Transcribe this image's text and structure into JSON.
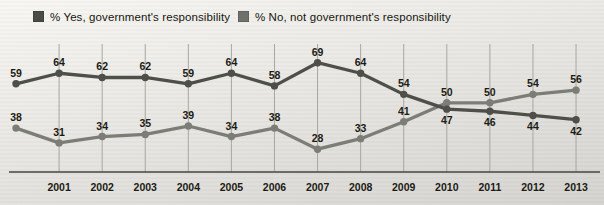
{
  "legend": {
    "items": [
      {
        "id": "yes",
        "label": "% Yes, government's responsibility",
        "swatch_color": "#4b4b46"
      },
      {
        "id": "no",
        "label": "% No, not government's responsibility",
        "swatch_color": "#71716b"
      }
    ]
  },
  "chart_data": {
    "type": "line",
    "x": [
      2000,
      2001,
      2002,
      2003,
      2004,
      2005,
      2006,
      2007,
      2008,
      2009,
      2010,
      2011,
      2012,
      2013
    ],
    "x_tick_labels": [
      "2001",
      "2002",
      "2003",
      "2004",
      "2005",
      "2006",
      "2007",
      "2008",
      "2009",
      "2010",
      "2011",
      "2012",
      "2013"
    ],
    "series": [
      {
        "name": "% Yes, government's responsibility",
        "color": "#4f4f4a",
        "values": [
          59,
          64,
          62,
          62,
          59,
          64,
          58,
          69,
          64,
          54,
          47,
          46,
          44,
          42
        ]
      },
      {
        "name": "% No, not government's responsibility",
        "color": "#7d7d77",
        "values": [
          38,
          31,
          34,
          35,
          39,
          34,
          38,
          28,
          33,
          41,
          50,
          50,
          54,
          56
        ]
      }
    ],
    "ylim": [
      17,
      78
    ],
    "grid": "vertical-on-labeled-years",
    "legend_position": "top",
    "data_labels": true
  },
  "colors": {
    "grid_line": "#a7a7a1",
    "axis_line": "#45453f",
    "value_label": "#1b1b14",
    "tick_label": "#1b1b14"
  }
}
